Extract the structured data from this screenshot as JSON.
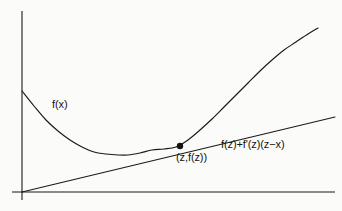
{
  "figure": {
    "title": "",
    "background_color": "#fbfbfa",
    "ink_color": "#1a1a1a",
    "labels": {
      "function_curve": "f(x)",
      "tangent_point": "(z,f(z))",
      "tangent_line": "f(z)+f'(z)(z−x)"
    },
    "axes": {
      "y_axis": {
        "x": 22,
        "y_top": 11,
        "y_bottom": 200
      },
      "x_axis": {
        "y": 192,
        "x_left": 12,
        "x_right": 335
      },
      "show_ticks": false,
      "show_tick_labels": false,
      "show_grid": false
    }
  },
  "chart_data": {
    "type": "line",
    "title": "",
    "xlabel": "",
    "ylabel": "",
    "xlim": [
      0,
      342
    ],
    "ylim": [
      0,
      211
    ],
    "grid": false,
    "legend": "none",
    "annotations": [
      {
        "name": "curve-label",
        "text": "f(x)",
        "x": 52,
        "y": 99
      },
      {
        "name": "point-label",
        "text": "(z,f(z))",
        "x": 176,
        "y": 152
      },
      {
        "name": "tangent-label",
        "text": "f(z)+f'(z)(z−x)",
        "x": 221,
        "y": 139
      }
    ],
    "series": [
      {
        "name": "f(x)",
        "type": "curve",
        "description": "convex function, decreasing then increasing, minimum near x=128",
        "points": [
          [
            22,
            91
          ],
          [
            34,
            106
          ],
          [
            46,
            120
          ],
          [
            58,
            131
          ],
          [
            70,
            140
          ],
          [
            82,
            147
          ],
          [
            94,
            152
          ],
          [
            106,
            154
          ],
          [
            118,
            155
          ],
          [
            128,
            155
          ],
          [
            140,
            153
          ],
          [
            152,
            150
          ],
          [
            164,
            149
          ],
          [
            176,
            147
          ],
          [
            188,
            140
          ],
          [
            200,
            130
          ],
          [
            212,
            119
          ],
          [
            224,
            107
          ],
          [
            236,
            95
          ],
          [
            248,
            83
          ],
          [
            260,
            71
          ],
          [
            272,
            60
          ],
          [
            284,
            50
          ],
          [
            296,
            42
          ],
          [
            308,
            34
          ],
          [
            318,
            28
          ]
        ]
      },
      {
        "name": "f(z)+f'(z)(z-x)",
        "type": "line",
        "description": "tangent line to f at the point (z,f(z))",
        "points": [
          [
            22,
            192
          ],
          [
            335,
            117
          ]
        ]
      }
    ],
    "markers": [
      {
        "name": "tangency-point",
        "label": "(z,f(z))",
        "x": 180,
        "y": 146,
        "radius": 3.2
      }
    ]
  }
}
